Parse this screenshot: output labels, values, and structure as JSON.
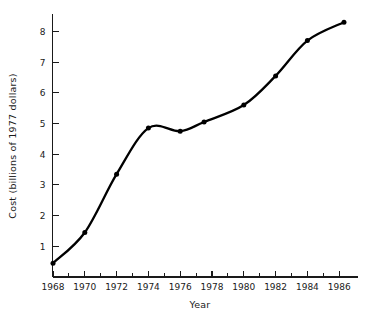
{
  "chart_data": {
    "type": "line",
    "title": "",
    "xlabel": "Year",
    "ylabel": "Cost (billions of 1977 dollars)",
    "xlim": [
      1967.7,
      1987.0
    ],
    "ylim": [
      0,
      8.6
    ],
    "grid": false,
    "legend": null,
    "x": [
      1968,
      1970,
      1972,
      1974,
      1976,
      1977.5,
      1980,
      1982,
      1984,
      1986.3
    ],
    "values": [
      0.45,
      1.45,
      3.35,
      4.85,
      4.75,
      5.05,
      5.6,
      6.55,
      7.7,
      8.3
    ],
    "series": [
      {
        "name": "Cost",
        "values": [
          0.45,
          1.45,
          3.35,
          4.85,
          4.75,
          5.05,
          5.6,
          6.55,
          7.7,
          8.3
        ]
      }
    ],
    "x_tick_labels": [
      "1968",
      "1970",
      "1972",
      "1974",
      "1976",
      "1978",
      "1980",
      "1982",
      "1984",
      "1986"
    ],
    "x_tick_values": [
      1968,
      1970,
      1972,
      1974,
      1976,
      1978,
      1980,
      1982,
      1984,
      1986
    ],
    "x_minor_ticks": [
      1969,
      1971,
      1973,
      1975,
      1977,
      1979,
      1981,
      1983,
      1985
    ],
    "y_tick_labels": [
      "1",
      "2",
      "3",
      "4",
      "5",
      "6",
      "7",
      "8"
    ],
    "y_tick_values": [
      1,
      2,
      3,
      4,
      5,
      6,
      7,
      8
    ],
    "line_color": "#000000",
    "marker_color": "#000000",
    "background_color": "#ffffff",
    "axis_color": "#1a1a1a"
  }
}
